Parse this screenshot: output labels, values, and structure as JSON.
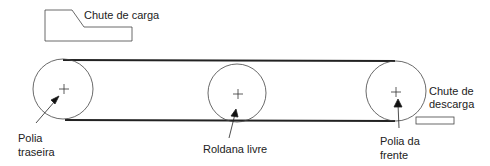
{
  "diagram": {
    "labels": {
      "chute_carga": "Chute de carga",
      "chute_descarga_line1": "Chute de",
      "chute_descarga_line2": "descarga",
      "polia_traseira_line1": "Polia",
      "polia_traseira_line2": "traseira",
      "roldana_livre": "Roldana livre",
      "polia_frente_line1": "Polia da",
      "polia_frente_line2": "frente"
    },
    "components": [
      {
        "id": "polia-traseira",
        "type": "pulley",
        "cx": 63,
        "cy": 89,
        "r": 30
      },
      {
        "id": "roldana-livre",
        "type": "idler",
        "cx": 237,
        "cy": 94,
        "r": 29
      },
      {
        "id": "polia-frente",
        "type": "pulley",
        "cx": 395,
        "cy": 91,
        "r": 30
      },
      {
        "id": "chute-carga",
        "type": "chute"
      },
      {
        "id": "chute-descarga",
        "type": "chute"
      }
    ],
    "colors": {
      "line": "#222222",
      "background": "#ffffff"
    }
  }
}
